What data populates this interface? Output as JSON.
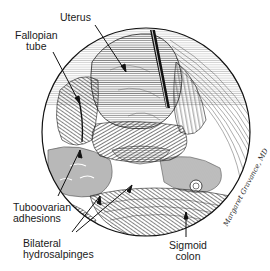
{
  "figure": {
    "type": "laparoscopic anatomical illustration",
    "labels": {
      "uterus": "Uterus",
      "fallopian_tube": [
        "Fallopian",
        "tube"
      ],
      "tuboovarian_adhesions": [
        "Tuboovarian",
        "adhesions"
      ],
      "bilateral_hydrosalpinges": [
        "Bilateral",
        "hydrosalpinges"
      ],
      "sigmoid_colon": [
        "Sigmoid",
        "colon"
      ]
    },
    "signature": "Margaret Gravance, MD",
    "colors": {
      "ink": "#1a1a1a",
      "background": "#ffffff"
    }
  }
}
